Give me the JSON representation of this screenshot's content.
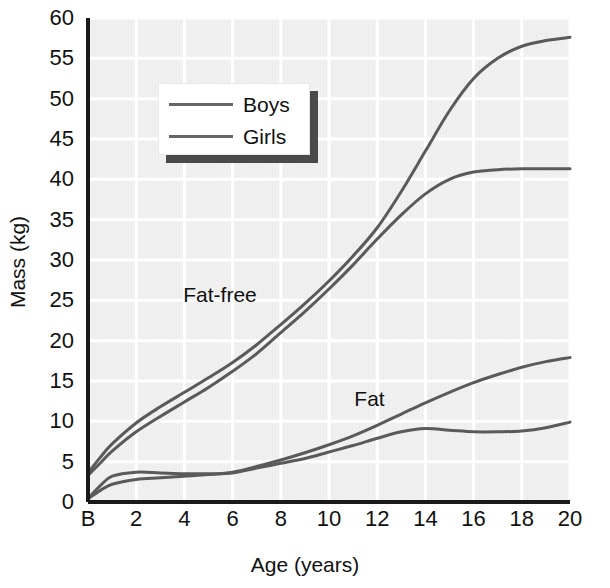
{
  "chart_data": {
    "type": "line",
    "title": "",
    "xlabel": "Age (years)",
    "ylabel": "Mass (kg)",
    "xlim": [
      0,
      20
    ],
    "ylim": [
      0,
      60
    ],
    "xticks": [
      "B",
      "2",
      "4",
      "6",
      "8",
      "10",
      "12",
      "14",
      "16",
      "18",
      "20"
    ],
    "xtick_values": [
      0,
      2,
      4,
      6,
      8,
      10,
      12,
      14,
      16,
      18,
      20
    ],
    "yticks": [
      "0",
      "5",
      "10",
      "15",
      "20",
      "25",
      "30",
      "35",
      "40",
      "45",
      "50",
      "55",
      "60"
    ],
    "ytick_values": [
      0,
      5,
      10,
      15,
      20,
      25,
      30,
      35,
      40,
      45,
      50,
      55,
      60
    ],
    "grid": true,
    "grid_color": "#ffffff",
    "plot_bg": "#ededed",
    "line_color": "#5a5a5a",
    "legend_position": "upper-left-inside",
    "annotations": [
      {
        "text": "Fat-free",
        "x": 4.2,
        "y": 25.5
      },
      {
        "text": "Fat",
        "x": 11.3,
        "y": 12.6
      }
    ],
    "x": [
      0,
      0.5,
      1,
      2,
      3,
      4,
      5,
      6,
      7,
      8,
      9,
      10,
      11,
      12,
      13,
      14,
      15,
      16,
      17,
      18,
      19,
      20
    ],
    "series": [
      {
        "name": "Fat-free, Boys",
        "component": "Fat-free",
        "group": "Boys",
        "values": [
          3.6,
          5.5,
          7.2,
          9.8,
          11.8,
          13.6,
          15.4,
          17.3,
          19.5,
          22.0,
          24.6,
          27.4,
          30.5,
          34.0,
          38.5,
          43.5,
          48.5,
          52.5,
          55.0,
          56.5,
          57.2,
          57.6
        ]
      },
      {
        "name": "Fat-free, Girls",
        "component": "Fat-free",
        "group": "Girls",
        "values": [
          3.3,
          4.8,
          6.3,
          8.7,
          10.6,
          12.4,
          14.2,
          16.2,
          18.4,
          21.0,
          23.6,
          26.4,
          29.4,
          32.6,
          35.6,
          38.2,
          40.0,
          40.9,
          41.2,
          41.3,
          41.3,
          41.3
        ]
      },
      {
        "name": "Fat, Girls",
        "component": "Fat",
        "group": "Girls",
        "values": [
          0.4,
          1.4,
          2.2,
          2.8,
          3.0,
          3.2,
          3.4,
          3.7,
          4.4,
          5.2,
          6.1,
          7.1,
          8.2,
          9.5,
          10.9,
          12.3,
          13.6,
          14.8,
          15.8,
          16.7,
          17.4,
          17.9
        ]
      },
      {
        "name": "Fat, Boys",
        "component": "Fat",
        "group": "Boys",
        "values": [
          0.4,
          2.0,
          3.2,
          3.7,
          3.6,
          3.5,
          3.5,
          3.6,
          4.2,
          4.8,
          5.4,
          6.2,
          7.0,
          7.9,
          8.7,
          9.1,
          8.9,
          8.7,
          8.7,
          8.8,
          9.2,
          9.9
        ]
      }
    ]
  },
  "legend": {
    "entries": [
      {
        "label": "Boys"
      },
      {
        "label": "Girls"
      }
    ]
  }
}
